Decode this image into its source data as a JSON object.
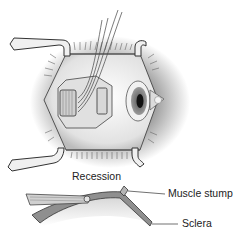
{
  "diagram": {
    "title": "Recession",
    "labels": {
      "muscle_stump": "Muscle stump",
      "sclera": "Sclera"
    },
    "views": [
      "Surgical view: eye held open with lid speculum, rectus muscle detached and held with sutures",
      "Cross-section: recessed muscle reattached posteriorly on sclera"
    ],
    "colors": {
      "background": "#ffffff",
      "sclera_fill": "#8f8f8f",
      "line": "#333333",
      "shading": "#b5b5b5"
    }
  }
}
